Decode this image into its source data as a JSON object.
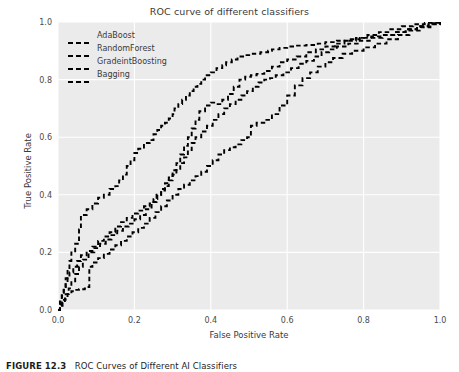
{
  "figure": {
    "caption_label": "FIGURE 12.3",
    "caption_text": "ROC Curves of Different AI Classifiers"
  },
  "chart_data": {
    "type": "line",
    "title": "ROC curve of different classifiers",
    "xlabel": "False Positive Rate",
    "ylabel": "True Positive Rate",
    "xlim": [
      0.0,
      1.0
    ],
    "ylim": [
      0.0,
      1.0
    ],
    "xticks": [
      "0.0",
      "0.2",
      "0.4",
      "0.6",
      "0.8",
      "1.0"
    ],
    "xtickvals": [
      0.0,
      0.2,
      0.4,
      0.6,
      0.8,
      1.0
    ],
    "yticks": [
      "0.0",
      "0.2",
      "0.4",
      "0.6",
      "0.8",
      "1.0"
    ],
    "ytickvals": [
      0.0,
      0.2,
      0.4,
      0.6,
      0.8,
      1.0
    ],
    "grid": true,
    "grid_color": "#ffffff",
    "panel_color": "#ebebeb",
    "line_color": "#000000",
    "line_style": "dashed",
    "legend_position": "upper left",
    "series": [
      {
        "name": "AdaBoost",
        "color": "#000000",
        "x": [
          0.0,
          0.005,
          0.01,
          0.015,
          0.02,
          0.025,
          0.03,
          0.035,
          0.045,
          0.055,
          0.06,
          0.075,
          0.09,
          0.105,
          0.12,
          0.135,
          0.15,
          0.16,
          0.17,
          0.18,
          0.19,
          0.2,
          0.21,
          0.225,
          0.24,
          0.25,
          0.26,
          0.27,
          0.28,
          0.29,
          0.3,
          0.305,
          0.315,
          0.325,
          0.335,
          0.345,
          0.355,
          0.365,
          0.375,
          0.385,
          0.4,
          0.415,
          0.43,
          0.44,
          0.455,
          0.47,
          0.49,
          0.51,
          0.53,
          0.55,
          0.56,
          0.58,
          0.6,
          0.62,
          0.65,
          0.68,
          0.7,
          0.73,
          0.76,
          0.79,
          0.82,
          0.85,
          0.88,
          0.91,
          0.94,
          0.97,
          1.0
        ],
        "y": [
          0.0,
          0.03,
          0.06,
          0.08,
          0.11,
          0.14,
          0.17,
          0.2,
          0.23,
          0.28,
          0.33,
          0.35,
          0.37,
          0.39,
          0.4,
          0.42,
          0.43,
          0.45,
          0.47,
          0.5,
          0.52,
          0.545,
          0.56,
          0.58,
          0.59,
          0.61,
          0.625,
          0.64,
          0.65,
          0.665,
          0.68,
          0.7,
          0.715,
          0.73,
          0.745,
          0.76,
          0.775,
          0.785,
          0.8,
          0.815,
          0.825,
          0.84,
          0.85,
          0.86,
          0.87,
          0.88,
          0.885,
          0.89,
          0.895,
          0.9,
          0.905,
          0.91,
          0.915,
          0.918,
          0.92,
          0.925,
          0.93,
          0.935,
          0.94,
          0.945,
          0.95,
          0.955,
          0.965,
          0.975,
          0.985,
          0.995,
          1.0
        ]
      },
      {
        "name": "RandomForest",
        "color": "#000000",
        "x": [
          0.0,
          0.005,
          0.01,
          0.015,
          0.02,
          0.025,
          0.03,
          0.04,
          0.05,
          0.06,
          0.075,
          0.09,
          0.105,
          0.12,
          0.135,
          0.15,
          0.165,
          0.18,
          0.195,
          0.21,
          0.225,
          0.24,
          0.25,
          0.26,
          0.27,
          0.28,
          0.29,
          0.3,
          0.31,
          0.32,
          0.33,
          0.34,
          0.35,
          0.36,
          0.375,
          0.39,
          0.405,
          0.42,
          0.435,
          0.45,
          0.465,
          0.48,
          0.495,
          0.51,
          0.525,
          0.54,
          0.555,
          0.57,
          0.59,
          0.61,
          0.63,
          0.65,
          0.67,
          0.69,
          0.71,
          0.73,
          0.76,
          0.79,
          0.82,
          0.85,
          0.88,
          0.91,
          0.94,
          0.97,
          1.0
        ],
        "y": [
          0.0,
          0.02,
          0.05,
          0.07,
          0.09,
          0.11,
          0.13,
          0.15,
          0.17,
          0.19,
          0.205,
          0.22,
          0.24,
          0.255,
          0.27,
          0.29,
          0.305,
          0.32,
          0.335,
          0.345,
          0.36,
          0.37,
          0.385,
          0.4,
          0.415,
          0.43,
          0.45,
          0.47,
          0.49,
          0.51,
          0.53,
          0.555,
          0.58,
          0.6,
          0.62,
          0.64,
          0.66,
          0.68,
          0.7,
          0.715,
          0.73,
          0.745,
          0.76,
          0.775,
          0.79,
          0.8,
          0.805,
          0.815,
          0.825,
          0.84,
          0.855,
          0.865,
          0.88,
          0.895,
          0.905,
          0.915,
          0.925,
          0.935,
          0.945,
          0.955,
          0.965,
          0.975,
          0.985,
          0.995,
          1.0
        ]
      },
      {
        "name": "GradeintBoosting",
        "color": "#000000",
        "x": [
          0.0,
          0.005,
          0.012,
          0.02,
          0.028,
          0.035,
          0.045,
          0.055,
          0.065,
          0.08,
          0.095,
          0.11,
          0.125,
          0.14,
          0.155,
          0.17,
          0.185,
          0.2,
          0.215,
          0.23,
          0.245,
          0.258,
          0.27,
          0.28,
          0.29,
          0.3,
          0.31,
          0.32,
          0.33,
          0.34,
          0.35,
          0.36,
          0.37,
          0.385,
          0.4,
          0.415,
          0.43,
          0.445,
          0.46,
          0.475,
          0.49,
          0.505,
          0.52,
          0.54,
          0.56,
          0.58,
          0.6,
          0.625,
          0.65,
          0.675,
          0.7,
          0.725,
          0.75,
          0.78,
          0.81,
          0.84,
          0.87,
          0.9,
          0.93,
          0.96,
          1.0
        ],
        "y": [
          0.0,
          0.015,
          0.035,
          0.055,
          0.075,
          0.1,
          0.125,
          0.15,
          0.175,
          0.2,
          0.215,
          0.23,
          0.245,
          0.26,
          0.275,
          0.29,
          0.3,
          0.315,
          0.33,
          0.35,
          0.375,
          0.4,
          0.42,
          0.44,
          0.46,
          0.485,
          0.51,
          0.54,
          0.57,
          0.6,
          0.63,
          0.66,
          0.69,
          0.71,
          0.72,
          0.715,
          0.73,
          0.75,
          0.775,
          0.8,
          0.81,
          0.815,
          0.82,
          0.83,
          0.845,
          0.86,
          0.87,
          0.88,
          0.895,
          0.905,
          0.915,
          0.925,
          0.935,
          0.945,
          0.955,
          0.965,
          0.975,
          0.985,
          0.992,
          0.997,
          1.0
        ]
      },
      {
        "name": "Bagging",
        "color": "#000000",
        "x": [
          0.0,
          0.005,
          0.01,
          0.018,
          0.025,
          0.035,
          0.045,
          0.055,
          0.07,
          0.08,
          0.082,
          0.09,
          0.105,
          0.12,
          0.135,
          0.15,
          0.165,
          0.18,
          0.195,
          0.21,
          0.225,
          0.24,
          0.255,
          0.27,
          0.285,
          0.3,
          0.315,
          0.33,
          0.345,
          0.36,
          0.375,
          0.39,
          0.405,
          0.42,
          0.435,
          0.45,
          0.465,
          0.48,
          0.495,
          0.505,
          0.52,
          0.54,
          0.56,
          0.58,
          0.6,
          0.62,
          0.64,
          0.66,
          0.68,
          0.7,
          0.72,
          0.745,
          0.77,
          0.8,
          0.83,
          0.86,
          0.89,
          0.92,
          0.95,
          0.975,
          1.0
        ],
        "y": [
          0.0,
          0.01,
          0.025,
          0.04,
          0.055,
          0.065,
          0.07,
          0.072,
          0.075,
          0.08,
          0.15,
          0.165,
          0.18,
          0.195,
          0.21,
          0.225,
          0.24,
          0.255,
          0.27,
          0.285,
          0.3,
          0.32,
          0.34,
          0.36,
          0.38,
          0.4,
          0.42,
          0.435,
          0.45,
          0.465,
          0.48,
          0.5,
          0.52,
          0.54,
          0.555,
          0.565,
          0.575,
          0.59,
          0.6,
          0.64,
          0.65,
          0.66,
          0.68,
          0.71,
          0.745,
          0.78,
          0.805,
          0.825,
          0.845,
          0.86,
          0.875,
          0.89,
          0.9,
          0.912,
          0.925,
          0.94,
          0.955,
          0.97,
          0.982,
          0.992,
          1.0
        ]
      }
    ]
  }
}
